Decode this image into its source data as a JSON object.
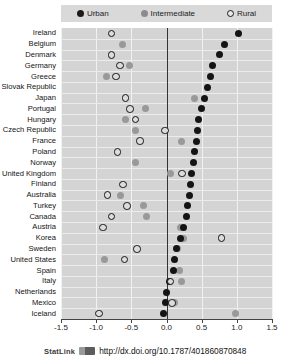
{
  "legend": {
    "items": [
      {
        "label": "Urban",
        "icon": "filled-dark-circle-icon",
        "color": "#141414"
      },
      {
        "label": "Intermediate",
        "icon": "filled-gray-circle-icon",
        "color": "#999999"
      },
      {
        "label": "Rural",
        "icon": "hollow-circle-icon",
        "color": "#ffffff"
      }
    ]
  },
  "footer": {
    "statlink_label": "StatLink",
    "doi": "http://dx.doi.org/10.1787/401860870848"
  },
  "chart_data": {
    "type": "scatter",
    "title": "",
    "xlabel": "",
    "ylabel": "",
    "xlim": [
      -1.5,
      1.5
    ],
    "xticks": [
      "-1.5",
      "-1.0",
      "-0.5",
      "0.0",
      "0.5",
      "1.0",
      "1.5"
    ],
    "xtick_values": [
      -1.5,
      -1.0,
      -0.5,
      0.0,
      0.5,
      1.0,
      1.5
    ],
    "grid": true,
    "legend_position": "top",
    "categories": [
      "Ireland",
      "Belgium",
      "Denmark",
      "Germany",
      "Greece",
      "Slovak Republic",
      "Japan",
      "Portugal",
      "Hungary",
      "Czech Republic",
      "France",
      "Poland",
      "Norway",
      "United Kingdom",
      "Finland",
      "Australia",
      "Turkey",
      "Canada",
      "Austria",
      "Korea",
      "Sweden",
      "United States",
      "Spain",
      "Italy",
      "Netherlands",
      "Mexico",
      "Iceland"
    ],
    "series": [
      {
        "name": "Urban",
        "marker": "filled-dark-circle",
        "color": "#141414",
        "values": [
          1.02,
          0.82,
          0.76,
          0.66,
          0.62,
          0.58,
          0.54,
          0.5,
          0.46,
          0.44,
          0.42,
          0.4,
          0.38,
          0.36,
          0.34,
          0.32,
          0.3,
          0.28,
          0.24,
          0.2,
          0.14,
          0.12,
          0.1,
          0.04,
          0.0,
          -0.02,
          -0.04
        ]
      },
      {
        "name": "Intermediate",
        "marker": "filled-gray-circle",
        "color": "#999999",
        "values": [
          null,
          -0.62,
          null,
          -0.52,
          -0.86,
          null,
          0.4,
          -0.3,
          -0.58,
          -0.44,
          0.22,
          null,
          -0.44,
          0.06,
          null,
          -0.66,
          -0.32,
          -0.28,
          0.2,
          0.24,
          0.16,
          -0.88,
          0.18,
          0.22,
          null,
          0.12,
          0.98
        ]
      },
      {
        "name": "Rural",
        "marker": "hollow-circle",
        "color": "#ffffff",
        "values": [
          -0.78,
          null,
          -0.78,
          -0.66,
          -0.72,
          null,
          -0.58,
          -0.52,
          -0.44,
          -0.02,
          -0.38,
          -0.7,
          null,
          0.22,
          -0.62,
          -0.84,
          -0.56,
          -0.78,
          -0.9,
          0.78,
          -0.42,
          -0.6,
          null,
          0.06,
          null,
          0.08,
          -0.96
        ]
      }
    ]
  }
}
